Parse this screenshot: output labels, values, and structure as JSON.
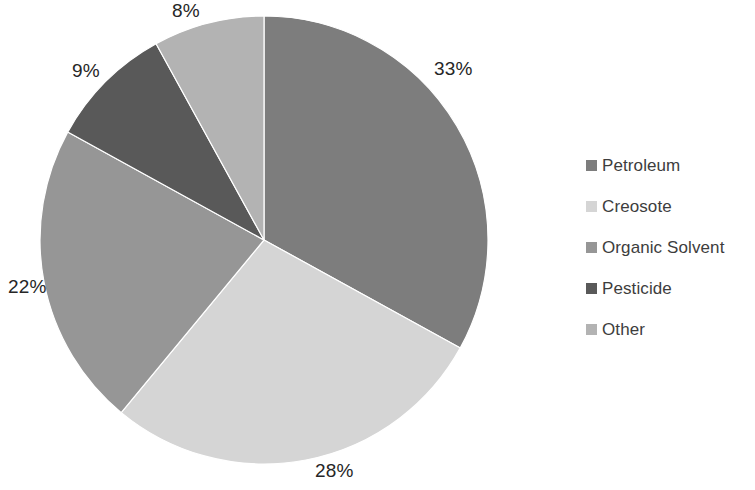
{
  "chart_data": {
    "type": "pie",
    "title": "",
    "subtitle": "",
    "xlabel": "",
    "ylabel": "",
    "grid": false,
    "legend_position": "right",
    "start_angle_deg": 0,
    "direction": "clockwise",
    "units": "percent",
    "total": 100,
    "categories": [
      "Petroleum",
      "Creosote",
      "Organic Solvent",
      "Pesticide",
      "Other"
    ],
    "values": [
      33,
      28,
      22,
      9,
      8
    ],
    "data_labels": [
      "33%",
      "28%",
      "22%",
      "9%",
      "8%"
    ],
    "colors": [
      "#7d7d7d",
      "#d5d5d5",
      "#969696",
      "#595959",
      "#b3b3b3"
    ],
    "slices": [
      {
        "label": "Petroleum",
        "value": 33,
        "data_label": "33%",
        "color": "#7d7d7d",
        "start_deg": 0,
        "end_deg": 118.8,
        "label_x": 434,
        "label_y": 58
      },
      {
        "label": "Creosote",
        "value": 28,
        "data_label": "28%",
        "color": "#d5d5d5",
        "start_deg": 118.8,
        "end_deg": 219.6,
        "label_x": 315,
        "label_y": 460
      },
      {
        "label": "Organic Solvent",
        "value": 22,
        "data_label": "22%",
        "color": "#969696",
        "start_deg": 219.6,
        "end_deg": 298.8,
        "label_x": 8,
        "label_y": 276
      },
      {
        "label": "Pesticide",
        "value": 9,
        "data_label": "9%",
        "color": "#595959",
        "start_deg": 298.8,
        "end_deg": 331.2,
        "label_x": 72,
        "label_y": 60
      },
      {
        "label": "Other",
        "value": 8,
        "data_label": "8%",
        "color": "#b3b3b3",
        "start_deg": 331.2,
        "end_deg": 360,
        "label_x": 172,
        "label_y": 0
      }
    ],
    "geometry": {
      "center_x": 264,
      "center_y": 240,
      "radius": 224
    }
  },
  "legend": {
    "items": [
      {
        "label": "Petroleum",
        "color": "#7d7d7d"
      },
      {
        "label": "Creosote",
        "color": "#d5d5d5"
      },
      {
        "label": "Organic Solvent",
        "color": "#969696"
      },
      {
        "label": "Pesticide",
        "color": "#595959"
      },
      {
        "label": "Other",
        "color": "#b3b3b3"
      }
    ]
  }
}
